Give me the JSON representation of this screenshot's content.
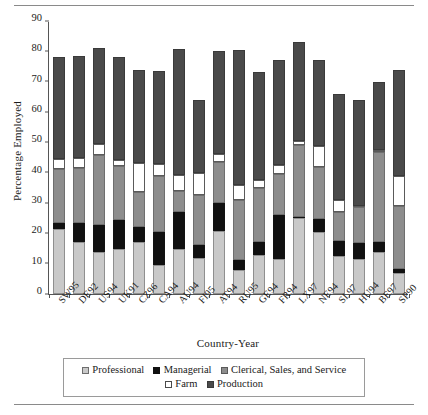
{
  "chart_data": {
    "type": "bar",
    "stacked": true,
    "title": "",
    "xlabel": "Country-Year",
    "ylabel": "Percentage Employed",
    "ylim": [
      0,
      90
    ],
    "yticks": [
      0,
      10,
      20,
      30,
      40,
      50,
      60,
      70,
      80,
      90
    ],
    "grid": false,
    "legend_position": "bottom",
    "categories": [
      "SW95",
      "DE92",
      "US94",
      "UK91",
      "CZ96",
      "CA94",
      "AU94",
      "FI95",
      "AT94",
      "RU95",
      "GE94",
      "FR94",
      "LX97",
      "NE94",
      "SL97",
      "HU94",
      "BE97",
      "SP90"
    ],
    "series": [
      {
        "name": "Professional",
        "color": "#c9c9c9",
        "values": [
          21.5,
          17.2,
          13.8,
          15.0,
          17.3,
          9.5,
          14.8,
          12.0,
          20.8,
          7.8,
          13.0,
          11.5,
          25.0,
          20.5,
          12.5,
          11.5,
          13.7,
          6.8
        ]
      },
      {
        "name": "Managerial",
        "color": "#111111",
        "values": [
          1.8,
          6.3,
          8.8,
          9.3,
          4.7,
          11.0,
          12.3,
          4.2,
          9.2,
          3.3,
          4.0,
          14.5,
          0.5,
          4.3,
          5.0,
          5.3,
          3.5,
          1.4
        ]
      },
      {
        "name": "Clerical, Sales, and Service",
        "color": "#8d8d8d",
        "values": [
          18.0,
          18.0,
          23.2,
          17.8,
          11.5,
          18.5,
          6.8,
          16.5,
          13.5,
          20.0,
          18.0,
          13.5,
          23.5,
          17.2,
          9.5,
          11.8,
          29.5,
          20.8
        ]
      },
      {
        "name": "Farm",
        "color": "#ffffff",
        "values": [
          3.2,
          3.3,
          3.5,
          2.0,
          9.8,
          4.0,
          5.5,
          7.3,
          2.5,
          5.0,
          2.7,
          3.0,
          1.6,
          6.8,
          4.0,
          0.5,
          0.8,
          9.8
        ]
      },
      {
        "name": "Production",
        "color": "#4a4a4a",
        "values": [
          33.5,
          33.7,
          31.9,
          34.0,
          30.5,
          30.5,
          41.5,
          23.8,
          34.0,
          44.4,
          35.6,
          34.5,
          32.4,
          28.2,
          35.0,
          35.0,
          22.5,
          35.2
        ]
      }
    ],
    "totals": [
      78.0,
      78.5,
      81.2,
      78.1,
      73.8,
      73.5,
      80.9,
      63.8,
      80.0,
      80.5,
      73.3,
      77.0,
      83.0,
      77.0,
      66.0,
      64.1,
      70.0,
      74.0
    ]
  },
  "legend": {
    "row1": [
      {
        "label": "Professional",
        "swatch": "sw-prof"
      },
      {
        "label": "Managerial",
        "swatch": "sw-mgr"
      },
      {
        "label": "Clerical, Sales, and Service",
        "swatch": "sw-cler"
      }
    ],
    "row2": [
      {
        "label": "Farm",
        "swatch": "sw-farm"
      },
      {
        "label": "Production",
        "swatch": "sw-prod"
      }
    ]
  }
}
